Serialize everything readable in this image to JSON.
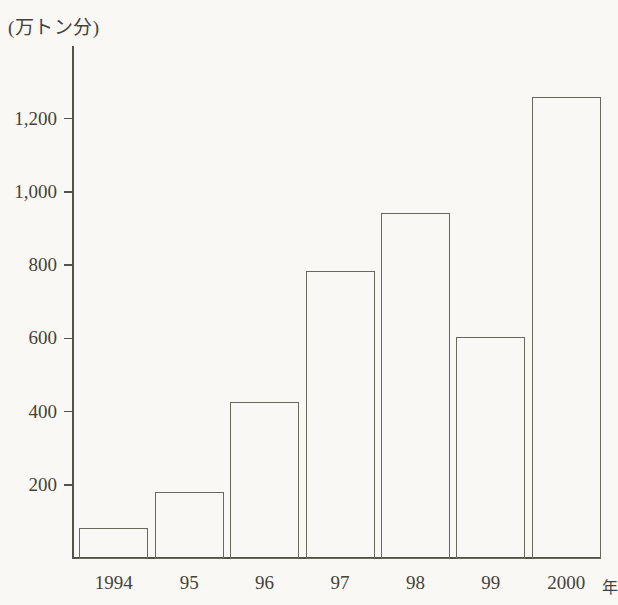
{
  "chart_data": {
    "type": "bar",
    "title": "",
    "subtitle": "",
    "xlabel": "年",
    "ylabel": "(万トン分)",
    "unit_caption": "(万トン分)",
    "categories": [
      "1994",
      "95",
      "96",
      "97",
      "98",
      "99",
      "2000"
    ],
    "values": [
      85,
      183,
      428,
      787,
      945,
      605,
      1262
    ],
    "ylim": [
      0,
      1400
    ],
    "ytick_values": [
      200,
      400,
      600,
      800,
      1000,
      1200
    ],
    "ytick_labels": [
      "200",
      "400",
      "600",
      "800",
      "1,000",
      "1,200"
    ],
    "grid": false,
    "legend": null,
    "legend_position": "none",
    "annotations": [],
    "series": [
      {
        "name": "",
        "values": [
          85,
          183,
          428,
          787,
          945,
          605,
          1262
        ]
      }
    ]
  },
  "style": {
    "background": "#faf8f4",
    "axis_color": "#55524a",
    "bar_edge_color": "#6b675d",
    "bar_fill_color": "transparent",
    "text_color": "#45423b"
  }
}
